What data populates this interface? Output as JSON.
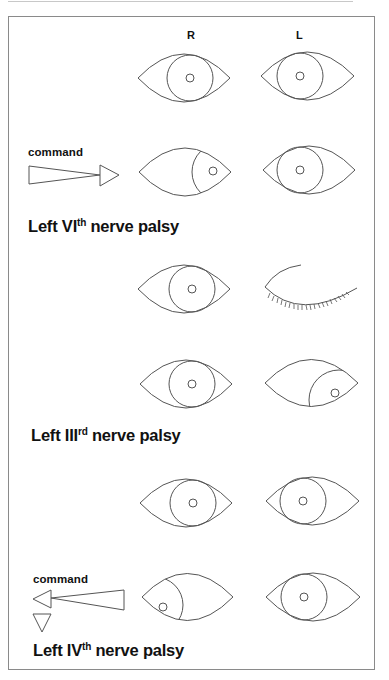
{
  "columns": {
    "right_label": "R",
    "left_label": "L"
  },
  "sections": [
    {
      "title_prefix": "Left VI",
      "title_sup": "th",
      "title_suffix": " nerve palsy",
      "command_label": "command",
      "command_direction": "right",
      "rows": [
        {
          "name": "primary",
          "R": "primary",
          "L": "primary"
        },
        {
          "name": "right-gaze",
          "R": "abducted (right)",
          "L": "fails to adduct... remains central"
        }
      ]
    },
    {
      "title_prefix": "Left III",
      "title_sup": "rd",
      "title_suffix": " nerve palsy",
      "rows": [
        {
          "name": "ptosis",
          "R": "primary",
          "L": "closed lid (ptosis)"
        },
        {
          "name": "lid-lifted",
          "R": "primary",
          "L": "down and out"
        }
      ]
    },
    {
      "title_prefix": "Left IV",
      "title_sup": "th",
      "title_suffix": " nerve palsy",
      "command_label": "command",
      "command_direction": "left and down",
      "rows": [
        {
          "name": "primary",
          "R": "primary",
          "L": "primary"
        },
        {
          "name": "left-down-gaze",
          "R": "looks left and down",
          "L": "remains central"
        }
      ]
    }
  ],
  "colors": {
    "line": "#555555",
    "frame": "#8a8a8a",
    "text": "#111111"
  }
}
